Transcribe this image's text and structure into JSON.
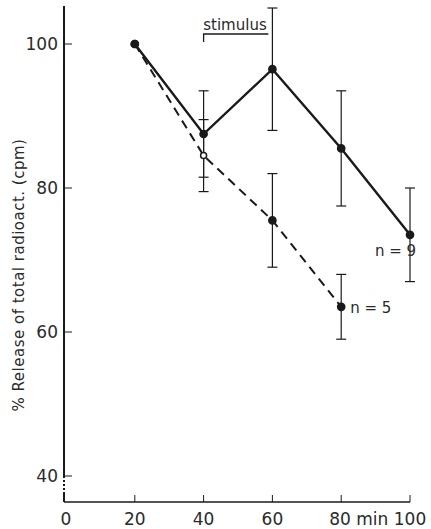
{
  "chart_data": {
    "type": "line",
    "title": "",
    "xlabel": "min",
    "ylabel": "% Release of total radioact. (cpm)",
    "xlim": [
      0,
      100
    ],
    "ylim": [
      40,
      105
    ],
    "x_ticks": [
      0,
      20,
      40,
      60,
      80,
      100
    ],
    "x_tick_labels": [
      "0",
      "20",
      "40",
      "60",
      "80 min",
      "100"
    ],
    "y_ticks": [
      40,
      60,
      80,
      100
    ],
    "y_tick_labels": [
      "40",
      "60",
      "80",
      "100"
    ],
    "grid": false,
    "legend": "none (series labeled inline)",
    "annotations": [
      {
        "text": "stimulus",
        "x_start": 40,
        "x_end": 60,
        "note": "bracket spanning 40–60 min"
      }
    ],
    "series": [
      {
        "name": "n = 9",
        "style": "solid",
        "marker": "filled-circle",
        "x": [
          20,
          40,
          60,
          80,
          100
        ],
        "values": [
          100,
          87.5,
          96.5,
          85.5,
          73.5
        ],
        "error": [
          0,
          6,
          8.5,
          8,
          6.5
        ]
      },
      {
        "name": "n = 5",
        "style": "dashed",
        "marker": "open/filled-circle",
        "x": [
          20,
          40,
          60,
          80
        ],
        "values": [
          100,
          84.5,
          75.5,
          63.5
        ],
        "error": [
          0,
          5,
          6.5,
          4.5
        ]
      }
    ]
  },
  "colors": {
    "ink": "#1a1a1a",
    "background": "#ffffff"
  }
}
